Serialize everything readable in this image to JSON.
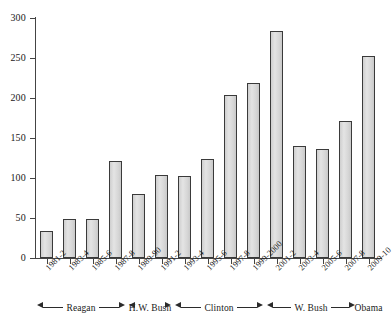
{
  "chart_data": {
    "type": "bar",
    "title": "",
    "xlabel": "",
    "ylabel": "",
    "ylim": [
      0,
      300
    ],
    "ytick_labels": [
      "0",
      "50",
      "100",
      "150",
      "200",
      "250",
      "300"
    ],
    "ytick_values": [
      0,
      50,
      100,
      150,
      200,
      250,
      300
    ],
    "grid": false,
    "legend": "none",
    "categories": [
      "1981-2",
      "1983-4",
      "1985-6",
      "1987-8",
      "1989-90",
      "1991-2",
      "1993-4",
      "1995-6",
      "1997-8",
      "1999-2000",
      "2001-2",
      "2003-4",
      "2005-6",
      "2007-8",
      "2009-10"
    ],
    "values": [
      34,
      49,
      49,
      121,
      80,
      104,
      103,
      124,
      204,
      219,
      284,
      140,
      136,
      171,
      253
    ],
    "annotations": [
      {
        "label": "Reagan",
        "from": "1981-2",
        "to": "1987-8"
      },
      {
        "label": "H.W. Bush",
        "from": "1989-90",
        "to": "1991-2"
      },
      {
        "label": "Clinton",
        "from": "1993-4",
        "to": "1999-2000"
      },
      {
        "label": "W. Bush",
        "from": "2001-2",
        "to": "2007-8"
      },
      {
        "label": "Obama",
        "from": "2009-10",
        "to": "2009-10"
      }
    ]
  },
  "presidents": [
    {
      "label": "Reagan"
    },
    {
      "label": "H.W. Bush"
    },
    {
      "label": "Clinton"
    },
    {
      "label": "W. Bush"
    },
    {
      "label": "Obama"
    }
  ]
}
